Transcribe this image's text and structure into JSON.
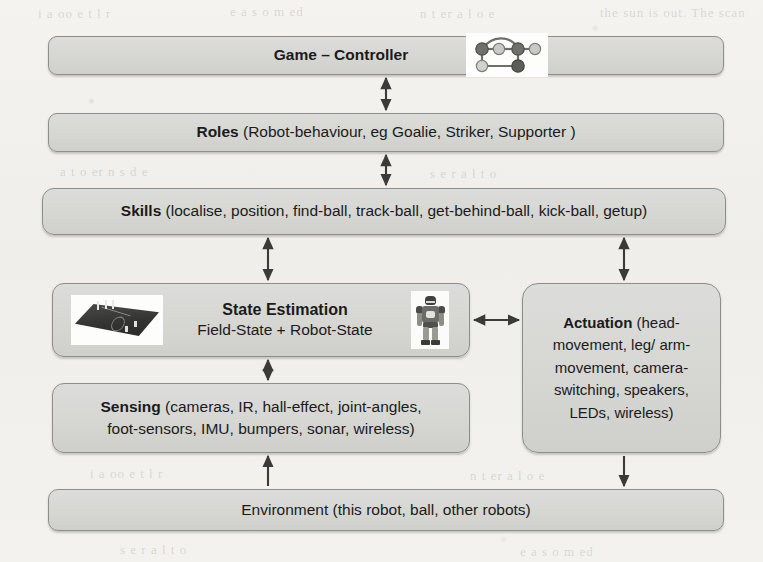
{
  "diagram": {
    "background_color": "#f2f1ee",
    "box_fill_color": "#d8d8d5",
    "box_border_color": "#8e8e8b",
    "layers": [
      {
        "id": "game-controller",
        "label": "Game – Controller",
        "bold_prefix": "Game – Controller",
        "detail": "",
        "icon": "network-graph-icon"
      },
      {
        "id": "roles",
        "bold_prefix": "Roles",
        "detail": " (Robot-behaviour, eg Goalie, Striker, Supporter )"
      },
      {
        "id": "skills",
        "bold_prefix": "Skills",
        "detail": " (localise, position, find-ball, track-ball, get-behind-ball, kick-ball, getup)"
      },
      {
        "id": "state-estimation",
        "bold_prefix": "State Estimation",
        "line2": "Field-State + Robot-State",
        "images": [
          "soccer-field-image",
          "humanoid-robot-image"
        ]
      },
      {
        "id": "actuation",
        "bold_prefix": "Actuation",
        "detail": " (head-movement, leg/ arm-movement, camera-switching, speakers, LEDs, wireless)"
      },
      {
        "id": "sensing",
        "bold_prefix": "Sensing",
        "detail_line1": " (cameras, IR, hall-effect, joint-angles,",
        "detail_line2": "foot-sensors, IMU, bumpers, sonar, wireless)"
      },
      {
        "id": "environment",
        "bold_prefix": "",
        "detail": "Environment (this robot, ball, other robots)"
      }
    ],
    "connectors": [
      {
        "id": "game-roles",
        "from": "game-controller",
        "to": "roles",
        "style": "double-headed-vertical"
      },
      {
        "id": "roles-skills",
        "from": "roles",
        "to": "skills",
        "style": "double-headed-vertical"
      },
      {
        "id": "skills-state",
        "from": "skills",
        "to": "state-estimation",
        "style": "double-headed-vertical"
      },
      {
        "id": "skills-actuation",
        "from": "skills",
        "to": "actuation",
        "style": "double-headed-vertical"
      },
      {
        "id": "state-actuation",
        "from": "state-estimation",
        "to": "actuation",
        "style": "double-headed-horizontal"
      },
      {
        "id": "state-sensing",
        "from": "state-estimation",
        "to": "sensing",
        "style": "double-headed-vertical"
      },
      {
        "id": "env-sensing",
        "from": "environment",
        "to": "sensing",
        "style": "single-headed-up"
      },
      {
        "id": "actuation-env",
        "from": "actuation",
        "to": "environment",
        "style": "single-headed-down"
      }
    ]
  },
  "ghost_text": {
    "g1": "the sun is out. The scan",
    "g2": "i  a  oo  e  t  l  r",
    "g3": "e   a   s  o  m  ed",
    "g4": "n  t  er  a  l  o  e",
    "g5": "a t  o  er  n  s  d e",
    "g6": "s  e  r  a  l  t  o"
  }
}
